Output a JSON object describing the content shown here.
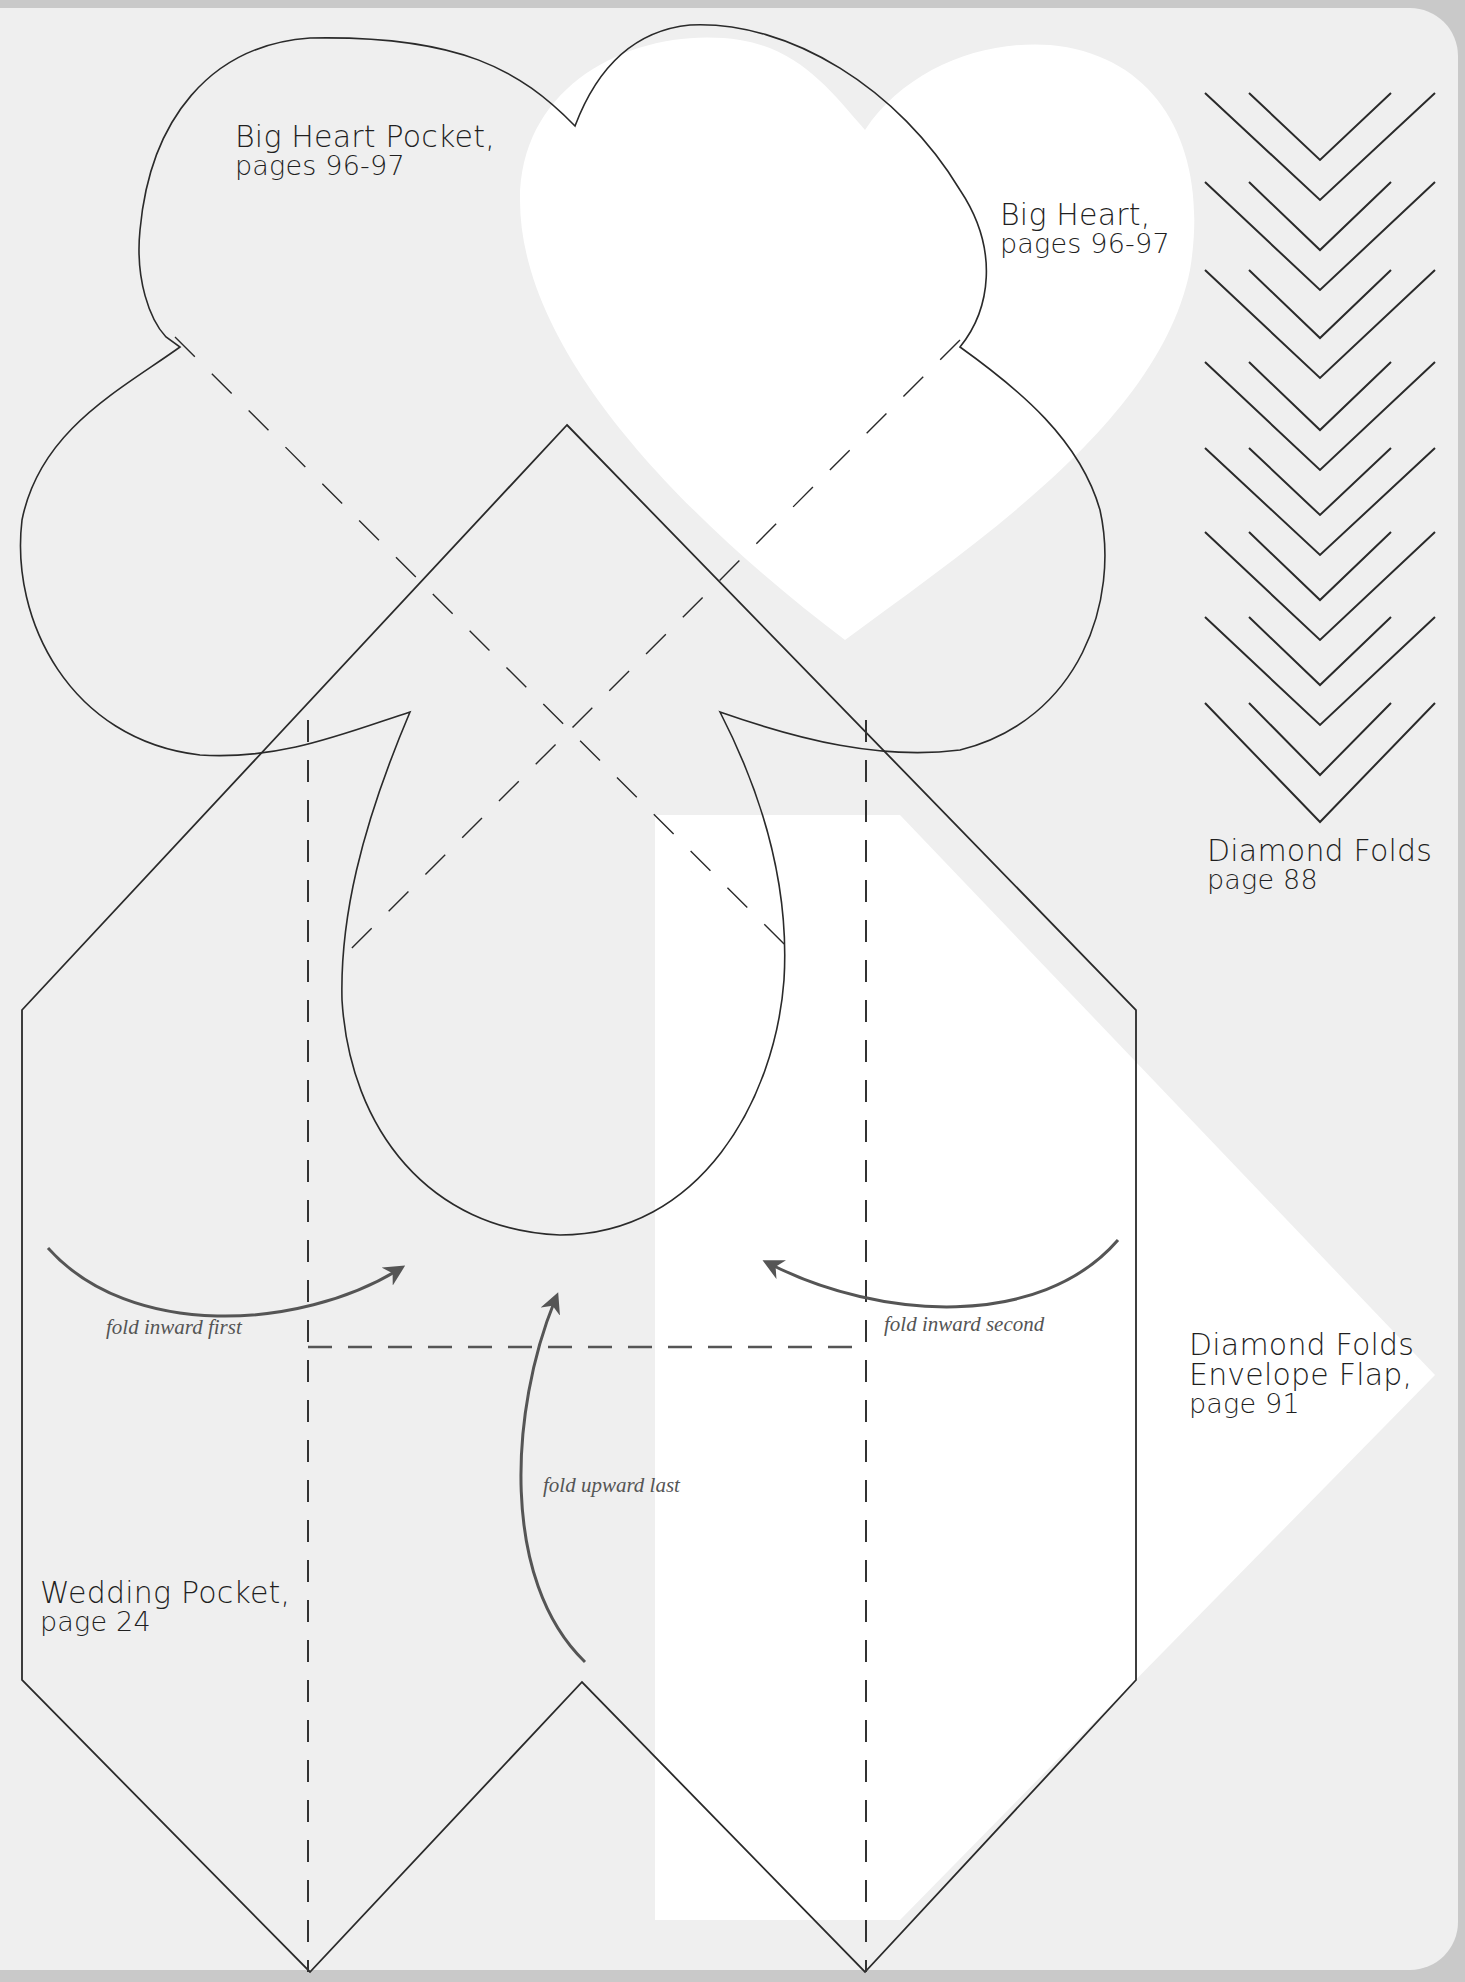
{
  "labels": {
    "big_heart_pocket": {
      "title": "Big Heart Pocket,",
      "pages": "pages 96-97"
    },
    "big_heart": {
      "title": "Big Heart,",
      "pages": "pages 96-97"
    },
    "diamond_folds": {
      "title": "Diamond Folds",
      "pages": "page 88"
    },
    "diamond_folds_flap": {
      "title1": "Diamond Folds",
      "title2": "Envelope Flap,",
      "pages": "page 91"
    },
    "wedding_pocket": {
      "title": "Wedding Pocket,",
      "pages": "page 24"
    }
  },
  "instructions": {
    "fold_first": "fold inward first",
    "fold_second": "fold inward second",
    "fold_last": "fold upward last"
  },
  "colors": {
    "page_background": "#efefef",
    "outer_border": "#c9c9c9",
    "template_fill": "#ffffff",
    "line": "#2a2a2a",
    "arrow": "#555555"
  },
  "chevron_rows": 8
}
